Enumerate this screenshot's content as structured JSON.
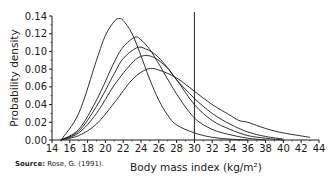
{
  "chart_data": {
    "type": "line",
    "title": "",
    "xlabel": "Body mass index (kg/m²)",
    "ylabel": "Probability density",
    "xlim": [
      14,
      44
    ],
    "ylim": [
      0,
      0.14
    ],
    "x_ticks": [
      14,
      16,
      18,
      20,
      22,
      24,
      26,
      28,
      30,
      32,
      34,
      36,
      38,
      40,
      42,
      44
    ],
    "y_ticks": [
      "0.00",
      "0.02",
      "0.04",
      "0.06",
      "0.08",
      "0.10",
      "0.12",
      "0.14"
    ],
    "grid": false,
    "legend": null,
    "annotations": [
      {
        "type": "vertical_line",
        "x": 30
      }
    ],
    "series": [
      {
        "name": "distribution-1",
        "x": [
          15,
          17,
          19,
          20,
          21,
          21.5,
          22,
          23,
          24,
          25,
          26,
          27,
          28,
          30,
          32,
          34,
          36
        ],
        "y": [
          0.0,
          0.03,
          0.09,
          0.118,
          0.134,
          0.137,
          0.135,
          0.12,
          0.095,
          0.068,
          0.045,
          0.028,
          0.017,
          0.008,
          0.003,
          0.001,
          0.0
        ]
      },
      {
        "name": "distribution-2",
        "x": [
          15,
          17,
          19,
          21,
          22,
          23.3,
          24,
          25,
          26,
          28,
          30,
          32,
          34,
          36,
          38
        ],
        "y": [
          0.0,
          0.012,
          0.045,
          0.088,
          0.105,
          0.116,
          0.113,
          0.102,
          0.086,
          0.052,
          0.025,
          0.012,
          0.006,
          0.002,
          0.0
        ]
      },
      {
        "name": "distribution-3",
        "x": [
          15,
          17,
          19,
          21,
          22,
          23.5,
          24.5,
          26,
          28,
          30,
          32,
          34,
          36,
          38,
          40
        ],
        "y": [
          0.0,
          0.01,
          0.038,
          0.075,
          0.092,
          0.104,
          0.103,
          0.093,
          0.068,
          0.04,
          0.022,
          0.012,
          0.005,
          0.002,
          0.0
        ]
      },
      {
        "name": "distribution-4",
        "x": [
          15,
          17,
          19,
          21,
          23,
          24.2,
          25.5,
          27,
          28,
          30,
          32,
          34,
          36,
          38,
          40
        ],
        "y": [
          0.0,
          0.008,
          0.03,
          0.062,
          0.087,
          0.095,
          0.093,
          0.081,
          0.068,
          0.047,
          0.03,
          0.018,
          0.009,
          0.004,
          0.001
        ]
      },
      {
        "name": "distribution-5",
        "x": [
          15,
          17,
          19,
          21,
          23,
          24.7,
          26,
          28,
          30,
          32,
          34,
          35,
          36,
          38,
          40,
          43
        ],
        "y": [
          0.0,
          0.005,
          0.018,
          0.042,
          0.068,
          0.08,
          0.079,
          0.07,
          0.055,
          0.04,
          0.028,
          0.022,
          0.02,
          0.013,
          0.008,
          0.003
        ]
      }
    ]
  },
  "source": {
    "label": "Source:",
    "text": " Rose, G. (1991)."
  },
  "axes": {
    "xlabel": "Body mass index (kg/m²)",
    "ylabel": "Probability density"
  }
}
